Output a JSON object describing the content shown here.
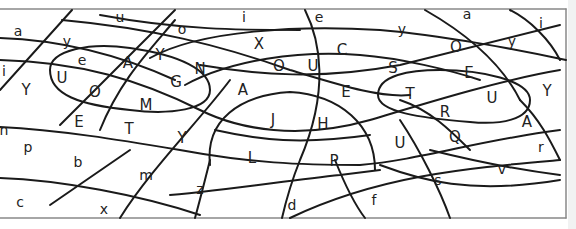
{
  "puzzle": {
    "description": "Curved grid letter puzzle",
    "line_color": "#1a1a1a",
    "background": "#ffffff",
    "cells": [
      {
        "id": "c1",
        "letter": "a",
        "x": 18,
        "y": 32
      },
      {
        "id": "c2",
        "letter": "u",
        "x": 120,
        "y": 18
      },
      {
        "id": "c3",
        "letter": "o",
        "x": 182,
        "y": 30
      },
      {
        "id": "c4",
        "letter": "i",
        "x": 244,
        "y": 18
      },
      {
        "id": "c5",
        "letter": "e",
        "x": 319,
        "y": 18
      },
      {
        "id": "c6",
        "letter": "y",
        "x": 402,
        "y": 30
      },
      {
        "id": "c7",
        "letter": "a",
        "x": 467,
        "y": 15
      },
      {
        "id": "c8",
        "letter": "i",
        "x": 541,
        "y": 24
      },
      {
        "id": "c9",
        "letter": "y",
        "x": 67,
        "y": 42
      },
      {
        "id": "c10",
        "letter": "Y",
        "x": 160,
        "y": 55
      },
      {
        "id": "c11",
        "letter": "X",
        "x": 259,
        "y": 44
      },
      {
        "id": "c12",
        "letter": "C",
        "x": 342,
        "y": 50
      },
      {
        "id": "c13",
        "letter": "O",
        "x": 456,
        "y": 47
      },
      {
        "id": "c14",
        "letter": "y",
        "x": 512,
        "y": 42
      },
      {
        "id": "c15",
        "letter": "e",
        "x": 82,
        "y": 61
      },
      {
        "id": "c16",
        "letter": "A",
        "x": 128,
        "y": 63
      },
      {
        "id": "c17",
        "letter": "N",
        "x": 200,
        "y": 69
      },
      {
        "id": "c18",
        "letter": "O",
        "x": 279,
        "y": 66
      },
      {
        "id": "c19",
        "letter": "U",
        "x": 313,
        "y": 66
      },
      {
        "id": "c20",
        "letter": "S",
        "x": 393,
        "y": 68
      },
      {
        "id": "c21",
        "letter": "E",
        "x": 469,
        "y": 73
      },
      {
        "id": "c22",
        "letter": "i",
        "x": 4,
        "y": 72
      },
      {
        "id": "c23",
        "letter": "U",
        "x": 62,
        "y": 78
      },
      {
        "id": "c24",
        "letter": "G",
        "x": 176,
        "y": 82
      },
      {
        "id": "c25",
        "letter": "Y",
        "x": 26,
        "y": 90
      },
      {
        "id": "c26",
        "letter": "O",
        "x": 95,
        "y": 92
      },
      {
        "id": "c27",
        "letter": "A",
        "x": 243,
        "y": 90
      },
      {
        "id": "c28",
        "letter": "E",
        "x": 346,
        "y": 92
      },
      {
        "id": "c29",
        "letter": "T",
        "x": 410,
        "y": 94
      },
      {
        "id": "c30",
        "letter": "U",
        "x": 492,
        "y": 98
      },
      {
        "id": "c31",
        "letter": "Y",
        "x": 547,
        "y": 91
      },
      {
        "id": "c32",
        "letter": "M",
        "x": 146,
        "y": 105
      },
      {
        "id": "c33",
        "letter": "R",
        "x": 445,
        "y": 112
      },
      {
        "id": "c34",
        "letter": "E",
        "x": 79,
        "y": 122
      },
      {
        "id": "c35",
        "letter": "J",
        "x": 273,
        "y": 120
      },
      {
        "id": "c36",
        "letter": "H",
        "x": 323,
        "y": 124
      },
      {
        "id": "c37",
        "letter": "A",
        "x": 527,
        "y": 122
      },
      {
        "id": "c38",
        "letter": "T",
        "x": 129,
        "y": 129
      },
      {
        "id": "c39",
        "letter": "n",
        "x": 4,
        "y": 131
      },
      {
        "id": "c40",
        "letter": "Y",
        "x": 182,
        "y": 138
      },
      {
        "id": "c41",
        "letter": "Q",
        "x": 455,
        "y": 137
      },
      {
        "id": "c42",
        "letter": "U",
        "x": 400,
        "y": 143
      },
      {
        "id": "c43",
        "letter": "p",
        "x": 28,
        "y": 148
      },
      {
        "id": "c44",
        "letter": "r",
        "x": 541,
        "y": 148
      },
      {
        "id": "c45",
        "letter": "L",
        "x": 252,
        "y": 158
      },
      {
        "id": "c46",
        "letter": "P",
        "x": 334,
        "y": 161
      },
      {
        "id": "c47",
        "letter": "b",
        "x": 78,
        "y": 163
      },
      {
        "id": "c48",
        "letter": "v",
        "x": 502,
        "y": 170
      },
      {
        "id": "c49",
        "letter": "m",
        "x": 146,
        "y": 176
      },
      {
        "id": "c50",
        "letter": "s",
        "x": 438,
        "y": 181
      },
      {
        "id": "c51",
        "letter": "z",
        "x": 200,
        "y": 190
      },
      {
        "id": "c52",
        "letter": "f",
        "x": 374,
        "y": 201
      },
      {
        "id": "c53",
        "letter": "c",
        "x": 20,
        "y": 203
      },
      {
        "id": "c54",
        "letter": "d",
        "x": 292,
        "y": 206
      },
      {
        "id": "c55",
        "letter": "x",
        "x": 104,
        "y": 210
      }
    ]
  }
}
